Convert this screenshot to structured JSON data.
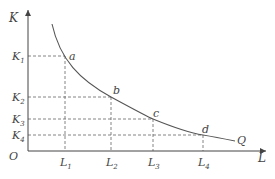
{
  "diagram": {
    "title": "",
    "axes": {
      "y_label": "K",
      "x_label": "L",
      "origin_label": "O"
    },
    "curve_label": "Q",
    "points": [
      {
        "name": "a",
        "k": "K",
        "k_sub": "1",
        "l": "L",
        "l_sub": "1"
      },
      {
        "name": "b",
        "k": "K",
        "k_sub": "2",
        "l": "L",
        "l_sub": "2"
      },
      {
        "name": "c",
        "k": "K",
        "k_sub": "3",
        "l": "L",
        "l_sub": "3"
      },
      {
        "name": "d",
        "k": "K",
        "k_sub": "4",
        "l": "L",
        "l_sub": "4"
      }
    ],
    "colors": {
      "axis": "#444444",
      "curve": "#555555",
      "guide": "#666666"
    }
  }
}
